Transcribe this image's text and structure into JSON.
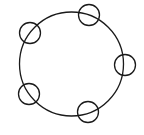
{
  "diagram": {
    "width": 144,
    "height": 135,
    "stroke_color": "#1a1a1a",
    "background": "#ffffff",
    "main_circle": {
      "cx": 71.5,
      "cy": 64,
      "r": 52
    },
    "small_circles": [
      {
        "name": "top",
        "cx": 89,
        "cy": 15,
        "r": 10.5
      },
      {
        "name": "upper-left",
        "cx": 30,
        "cy": 33,
        "r": 10.5
      },
      {
        "name": "right",
        "cx": 125,
        "cy": 65,
        "r": 10.5
      },
      {
        "name": "lower-left",
        "cx": 29,
        "cy": 94,
        "r": 10.5
      },
      {
        "name": "bottom",
        "cx": 88,
        "cy": 112,
        "r": 10.5
      }
    ]
  }
}
